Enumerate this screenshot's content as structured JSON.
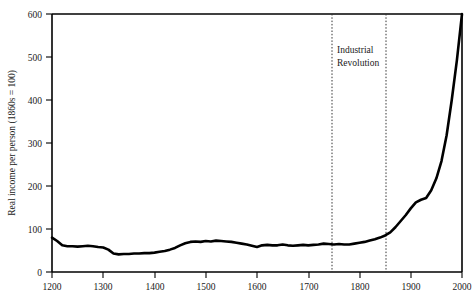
{
  "chart_data": {
    "type": "line",
    "title": "",
    "xlabel": "",
    "ylabel": "Real income per person (1860s = 100)",
    "xlim": [
      1200,
      2000
    ],
    "ylim": [
      0,
      600
    ],
    "grid": false,
    "legend": null,
    "x_ticks": [
      "1200",
      "1300",
      "1400",
      "1500",
      "1600",
      "1700",
      "1800",
      "1900",
      "2000"
    ],
    "y_ticks": [
      "0",
      "100",
      "200",
      "300",
      "400",
      "500",
      "600"
    ],
    "annotations": [
      {
        "label": "Industrial Revolution",
        "line1": "Industrial",
        "line2": "Revolution",
        "span_start": 1760,
        "span_end": 1860,
        "style": "dotted-vertical-lines"
      }
    ],
    "series": [
      {
        "name": "Real income per person",
        "color": "#000000",
        "x": [
          1200,
          1210,
          1220,
          1230,
          1240,
          1250,
          1260,
          1270,
          1280,
          1290,
          1300,
          1310,
          1320,
          1330,
          1340,
          1350,
          1360,
          1370,
          1380,
          1390,
          1400,
          1410,
          1420,
          1430,
          1440,
          1450,
          1460,
          1470,
          1480,
          1490,
          1500,
          1510,
          1520,
          1530,
          1540,
          1550,
          1560,
          1570,
          1580,
          1590,
          1600,
          1610,
          1620,
          1630,
          1640,
          1650,
          1660,
          1670,
          1680,
          1690,
          1700,
          1710,
          1720,
          1730,
          1740,
          1750,
          1760,
          1770,
          1780,
          1790,
          1800,
          1810,
          1820,
          1830,
          1840,
          1850,
          1860,
          1870,
          1880,
          1890,
          1900,
          1910,
          1920,
          1930,
          1940,
          1950,
          1960,
          1970,
          1980,
          1990,
          2000
        ],
        "y": [
          80,
          72,
          62,
          60,
          60,
          59,
          60,
          61,
          60,
          58,
          57,
          52,
          43,
          41,
          42,
          42,
          43,
          43,
          44,
          44,
          45,
          47,
          49,
          52,
          56,
          62,
          67,
          70,
          71,
          70,
          72,
          71,
          73,
          72,
          71,
          70,
          68,
          66,
          64,
          61,
          58,
          62,
          63,
          62,
          62,
          64,
          62,
          61,
          62,
          63,
          62,
          63,
          64,
          66,
          65,
          64,
          65,
          64,
          64,
          66,
          68,
          70,
          73,
          76,
          80,
          85,
          92,
          104,
          118,
          132,
          148,
          162,
          168,
          172,
          190,
          218,
          258,
          318,
          400,
          492,
          600
        ]
      }
    ]
  },
  "axis": {
    "y_title": "Real income per person (1860s = 100)"
  },
  "caption": {
    "text": ""
  }
}
